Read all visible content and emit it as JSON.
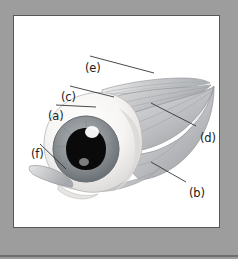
{
  "figure": {
    "kind": "anatomical-illustration",
    "panel_background": "#ffffff",
    "frame_color": "#9d9d9d",
    "frame_rule_color": "#6e6e6e",
    "panel_border_color": "#58585a",
    "label_color": "#1b1b1b",
    "labels": [
      {
        "key": "e",
        "text": "(e)",
        "target": "superior-oblique-muscle-tendon"
      },
      {
        "key": "c",
        "text": "(c)",
        "target": "superior-rectus-muscle"
      },
      {
        "key": "a",
        "text": "(a)",
        "target": "levator-palpebrae-muscle"
      },
      {
        "key": "d",
        "text": "(d)",
        "target": "lateral-rectus-muscle"
      },
      {
        "key": "f",
        "text": "(f)",
        "target": "inferior-oblique-muscle"
      },
      {
        "key": "b",
        "text": "(b)",
        "target": "inferior-rectus-muscle"
      }
    ],
    "eye": {
      "sclera_color": "#f4f3f1",
      "iris_color": "#8f9396",
      "pupil_color": "#0a0a0a",
      "highlight_color": "#ffffff"
    },
    "muscle": {
      "fill_color": "#cfd0d2",
      "stroke_color": "#8d9094",
      "striation_color": "#a9acaf"
    }
  }
}
